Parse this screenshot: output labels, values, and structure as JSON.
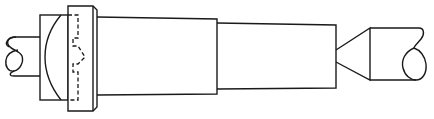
{
  "diagram": {
    "title": "Shaft assembly with flanged coupling and tapered end",
    "style": {
      "line_color": "#1a1a1a",
      "background": "#ffffff"
    },
    "components": [
      {
        "id": "left-shaft-break",
        "label": "Left shaft (broken end)"
      },
      {
        "id": "hub",
        "label": "Hub with curved face"
      },
      {
        "id": "flange",
        "label": "Flange with hidden interlocking profile"
      },
      {
        "id": "main-body",
        "label": "Main cylindrical body"
      },
      {
        "id": "stepped-section",
        "label": "Stepped reduced section"
      },
      {
        "id": "cone-tip",
        "label": "Conical point"
      },
      {
        "id": "right-shaft-break",
        "label": "Right shaft (broken end)"
      }
    ]
  }
}
